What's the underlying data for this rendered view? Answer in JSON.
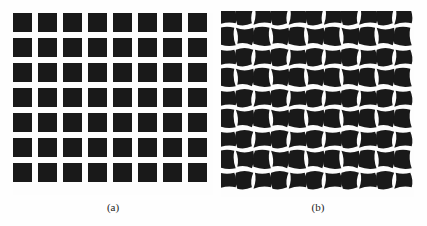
{
  "figure": {
    "background_color": "#fefefe",
    "ink_color": "#191919",
    "width": 427,
    "height": 226
  },
  "panels": [
    {
      "id": "panel-a",
      "caption": "(a)",
      "description": "regular square calibration grid",
      "pattern": "squares",
      "columns": 8,
      "rows": 7,
      "square_size_px": 19,
      "pitch_x_px": 25,
      "pitch_y_px": 25,
      "origin": {
        "x": 13,
        "y": 13
      },
      "fill_color": "#191919",
      "background_color": "#fdfdfd"
    },
    {
      "id": "panel-b",
      "caption": "(b)",
      "description": "grid with wavy barrel/pincushion lens distortion",
      "pattern": "distorted-squares",
      "columns": 11,
      "rows": 9,
      "cell_size_px": 16,
      "pitch_x_px": 17.6,
      "pitch_y_px": 20.5,
      "origin": {
        "x": 221,
        "y": 11
      },
      "fill_color": "#191919",
      "background_color": "#fdfdfd",
      "distortion": {
        "type": "sinusoidal-edge-warp",
        "edge_amplitude_px": 2.6,
        "corner_twist_px": 1.4
      }
    }
  ],
  "chart_data": {
    "type": "heatmap",
    "title": "",
    "xlabel": "",
    "ylabel": "",
    "panels": [
      {
        "label": "(a)",
        "grid": "8 x 7 undistorted squares"
      },
      {
        "label": "(b)",
        "grid": "11 x 9 distorted squares"
      }
    ]
  }
}
